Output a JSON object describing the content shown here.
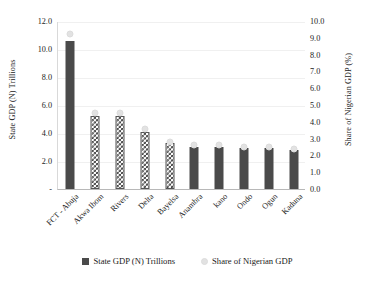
{
  "chart_data": {
    "type": "bar",
    "title": "",
    "xlabel": "",
    "ylabel": "State GDP (N) Trillions",
    "y2label": "Share of Nigerian GDP (%)",
    "ylim": [
      0,
      12
    ],
    "y2lim": [
      0,
      10
    ],
    "grid": true,
    "legend_position": "bottom",
    "categories": [
      "FCT - Abuja",
      "Akwa Ibom",
      "Rivers",
      "Delta",
      "Bayelsa",
      "Anambra",
      "kano",
      "Ondo",
      "Ogun",
      "Kaduna"
    ],
    "yticks": [
      "12.0",
      "10.0",
      "8.0",
      "6.0",
      "4.0",
      "2.0",
      "-"
    ],
    "ytick_values": [
      12.0,
      10.0,
      8.0,
      6.0,
      4.0,
      2.0,
      0
    ],
    "y2ticks": [
      "10.0",
      "9.0",
      "8.0",
      "7.0",
      "6.0",
      "5.0",
      "4.0",
      "3.0",
      "2.0",
      "1.0",
      "0.0"
    ],
    "y2tick_values": [
      10.0,
      9.0,
      8.0,
      7.0,
      6.0,
      5.0,
      4.0,
      3.0,
      2.0,
      1.0,
      0.0
    ],
    "series": [
      {
        "name": "State GDP (N) Trillions",
        "axis": "left",
        "style": "bar",
        "values": [
          10.6,
          5.2,
          5.2,
          4.1,
          3.3,
          3.0,
          3.0,
          2.9,
          2.9,
          2.8
        ]
      },
      {
        "name": "Share of Nigerian GDP",
        "axis": "right",
        "style": "marker",
        "values": [
          9.2,
          4.5,
          4.5,
          3.6,
          2.8,
          2.6,
          2.6,
          2.5,
          2.5,
          2.4
        ]
      }
    ],
    "bar_fills": [
      "solid",
      "checker",
      "checker",
      "checker",
      "checker",
      "solid",
      "solid",
      "solid",
      "solid",
      "solid"
    ],
    "colors": {
      "bar_dark": "#4a4a4a",
      "marker_light": "#e2e2e2",
      "gridline": "#f0f0f0",
      "axis": "#b8b8b8"
    }
  },
  "legend": [
    {
      "label": "State GDP (N) Trillions",
      "swatch": "square"
    },
    {
      "label": "Share of Nigerian GDP",
      "swatch": "circle"
    }
  ]
}
